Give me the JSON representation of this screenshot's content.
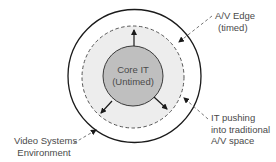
{
  "diagram": {
    "core": {
      "line1": "Core IT",
      "line2": "(Untimed)"
    },
    "labels": {
      "av_edge": {
        "line1": "A/V Edge",
        "line2": "(timed)"
      },
      "it_pushing": {
        "line1": "IT pushing",
        "line2": "into traditional",
        "line3": "A/V space"
      },
      "video_env": {
        "line1": "Video Systems",
        "line2": "Environment"
      }
    },
    "colors": {
      "outer_ring_fill": "#ffffff",
      "middle_ring_fill": "#ededed",
      "core_fill": "#bfbfbf",
      "stroke": "#1a1a1a",
      "text": "#4a4a4a"
    }
  }
}
